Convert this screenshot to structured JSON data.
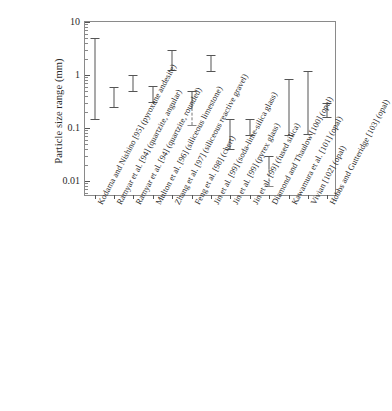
{
  "chart_data": {
    "type": "bar",
    "subtype": "range-interval (error-bar style min-max ranges)",
    "title": "",
    "xlabel": "",
    "ylabel": "Particle size range (mm)",
    "yscale": "log",
    "ylim": [
      0.005,
      10
    ],
    "ytick_labels": [
      "10",
      "1",
      "0.1",
      "0.01"
    ],
    "ytick_values": [
      10,
      1,
      0.1,
      0.01
    ],
    "grid": false,
    "legend": null,
    "categories": [
      "Kodama and Nishino [95] (pyroxene andesite)",
      "Ramyar et al. [94] (quartzite, angular)",
      "Ramyar et al. [94] (quartzite, rounded)",
      "Multon et al. [96] (siliceous limestone)",
      "Zhang et al. [97] (siliceous reactive gravel)",
      "Feng et al. [98] (chert)",
      "Jin et al. [99] (soda-lime-silica glass)",
      "Jin et al. [99] (pyrex glass)",
      "Jin et al. [99] (fused silica)",
      "Diamond and Thaulow [100] (opal)",
      "Kawamura et al. [101] (opal)",
      "Vivian [102] (opal)",
      "Hobbs and Gutteridge [103] (opal)"
    ],
    "ranges": [
      {
        "label": "Kodama and Nishino [95] (pyroxene andesite)",
        "min": 0.15,
        "max": 5.0,
        "dashed_low": false
      },
      {
        "label": "Ramyar et al. [94] (quartzite, angular)",
        "min": 0.25,
        "max": 0.6,
        "dashed_low": false
      },
      {
        "label": "Ramyar et al. [94] (quartzite, rounded)",
        "min": 0.5,
        "max": 1.0,
        "dashed_low": false
      },
      {
        "label": "Multon et al. [96] (siliceous limestone)",
        "min": 0.315,
        "max": 0.63,
        "dashed_low": false
      },
      {
        "label": "Zhang et al. [97] (siliceous reactive gravel)",
        "min": 1.25,
        "max": 3.0,
        "dashed_low": false
      },
      {
        "label": "Feng et al. [98] (chert)",
        "min": 0.115,
        "max": 0.5,
        "dashed_low": true
      },
      {
        "label": "Jin et al. [99] (soda-lime-silica glass)",
        "min": 1.18,
        "max": 2.4,
        "dashed_low": false
      },
      {
        "label": "Jin et al. [99] (pyrex glass)",
        "min": 0.04,
        "max": 0.15,
        "dashed_low": false
      },
      {
        "label": "Jin et al. [99] (fused silica)",
        "min": 0.075,
        "max": 0.15,
        "dashed_low": false
      },
      {
        "label": "Diamond and Thaulow [100] (opal)",
        "min": 0.008,
        "max": 0.03,
        "dashed_low": true
      },
      {
        "label": "Kawamura et al. [101] (opal)",
        "min": 0.074,
        "max": 0.85,
        "dashed_low": false
      },
      {
        "label": "Vivian [102] (opal)",
        "min": 0.077,
        "max": 1.2,
        "dashed_low": false
      },
      {
        "label": "Hobbs and Gutteridge [103] (opal)",
        "min": 0.16,
        "max": 0.3,
        "dashed_low": false
      }
    ]
  }
}
